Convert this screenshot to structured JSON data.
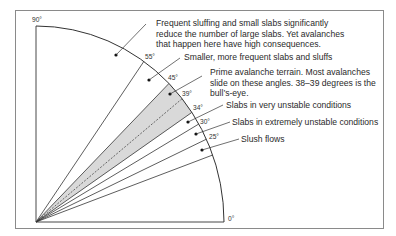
{
  "diagram": {
    "type": "slope-angle-fan",
    "angle_labels": {
      "a90": "90°",
      "a55": "55°",
      "a45": "45°",
      "a39": "39°",
      "a34": "34°",
      "a30": "30°",
      "a25": "25°",
      "a0": "0°"
    },
    "zones": [
      {
        "range": "55–90°",
        "line1": "Frequent sluffing and small slabs significantly",
        "line2": "reduce the number of large slabs. Yet avalanches",
        "line3": "that happen here have high consequences."
      },
      {
        "range": "45–55°",
        "line1": "Smaller, more frequent slabs and sluffs"
      },
      {
        "range": "34–45°",
        "line1": "Prime avalanche terrain. Most avalanches",
        "line2": "slide on these angles. 38–39 degrees is the",
        "line3": "bull’s-eye.",
        "shaded": true
      },
      {
        "range": "30–34°",
        "line1": "Slabs in very unstable conditions"
      },
      {
        "range": "25–30°",
        "line1": "Slabs in extremely unstable conditions"
      },
      {
        "range": "below 25°",
        "line1": "Slush flows"
      }
    ],
    "colors": {
      "shade": "#d9d9d9",
      "line": "#333333",
      "frame": "#888888"
    }
  }
}
